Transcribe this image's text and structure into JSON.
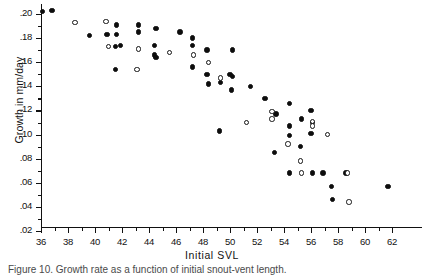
{
  "figure": {
    "caption": "Figure 10.  Growth rate as a function of initial snout-vent length."
  },
  "chart_data": {
    "type": "scatter",
    "title": "",
    "xlabel": "Initial SVL",
    "ylabel": "Growth in mm/day",
    "xlim": [
      35,
      63
    ],
    "ylim": [
      0.01,
      0.212
    ],
    "grid": false,
    "legend_position": "none",
    "x_ticks": [
      36,
      38,
      40,
      42,
      44,
      46,
      48,
      50,
      52,
      54,
      56,
      58,
      60,
      62
    ],
    "x_tick_labels": [
      "36",
      "38",
      "40",
      "42",
      "44",
      "46",
      "48",
      "50",
      "52",
      "54",
      "56",
      "58",
      "60",
      "62"
    ],
    "x_minor_ticks": [
      37,
      39,
      41,
      43,
      45,
      47,
      49,
      51,
      53,
      55,
      57,
      59,
      61
    ],
    "y_ticks": [
      0.02,
      0.04,
      0.06,
      0.08,
      0.1,
      0.12,
      0.14,
      0.16,
      0.18,
      0.2
    ],
    "y_tick_labels": [
      ".02",
      ".04",
      ".06",
      ".08",
      ".10",
      ".12",
      ".14",
      ".16",
      ".18",
      ".20"
    ],
    "y_minor_ticks": [
      0.03,
      0.05,
      0.07,
      0.09,
      0.11,
      0.13,
      0.15,
      0.17,
      0.19
    ],
    "series": [
      {
        "name": "filled",
        "marker": "filled-circle",
        "color": "#0d0d0d",
        "points": [
          [
            36.1,
            0.202
          ],
          [
            36.8,
            0.203
          ],
          [
            39.6,
            0.182
          ],
          [
            40.9,
            0.183
          ],
          [
            41.6,
            0.191
          ],
          [
            41.6,
            0.183
          ],
          [
            41.5,
            0.173
          ],
          [
            41.9,
            0.174
          ],
          [
            41.5,
            0.154
          ],
          [
            43.2,
            0.191
          ],
          [
            43.2,
            0.185
          ],
          [
            44.5,
            0.188
          ],
          [
            44.4,
            0.174
          ],
          [
            44.4,
            0.166
          ],
          [
            44.5,
            0.164
          ],
          [
            46.3,
            0.185
          ],
          [
            47.2,
            0.18
          ],
          [
            47.2,
            0.174
          ],
          [
            47.2,
            0.156
          ],
          [
            48.3,
            0.17
          ],
          [
            48.3,
            0.15
          ],
          [
            48.4,
            0.142
          ],
          [
            49.3,
            0.143
          ],
          [
            50.2,
            0.17
          ],
          [
            50.0,
            0.15
          ],
          [
            50.2,
            0.148
          ],
          [
            50.1,
            0.137
          ],
          [
            49.2,
            0.103
          ],
          [
            51.5,
            0.14
          ],
          [
            52.6,
            0.13
          ],
          [
            53.4,
            0.117
          ],
          [
            53.3,
            0.085
          ],
          [
            54.4,
            0.126
          ],
          [
            54.4,
            0.107
          ],
          [
            54.4,
            0.099
          ],
          [
            54.4,
            0.068
          ],
          [
            55.3,
            0.113
          ],
          [
            55.2,
            0.09
          ],
          [
            56.0,
            0.12
          ],
          [
            56.1,
            0.11
          ],
          [
            56.0,
            0.101
          ],
          [
            56.1,
            0.068
          ],
          [
            56.9,
            0.068
          ],
          [
            57.5,
            0.057
          ],
          [
            57.6,
            0.046
          ],
          [
            58.6,
            0.068
          ],
          [
            61.7,
            0.057
          ]
        ]
      },
      {
        "name": "open",
        "marker": "open-circle",
        "color": "#151515",
        "points": [
          [
            38.5,
            0.193
          ],
          [
            40.8,
            0.194
          ],
          [
            41.0,
            0.173
          ],
          [
            43.2,
            0.171
          ],
          [
            43.1,
            0.154
          ],
          [
            45.5,
            0.168
          ],
          [
            47.3,
            0.166
          ],
          [
            48.4,
            0.16
          ],
          [
            49.3,
            0.147
          ],
          [
            51.2,
            0.11
          ],
          [
            53.1,
            0.119
          ],
          [
            53.1,
            0.113
          ],
          [
            54.3,
            0.092
          ],
          [
            55.2,
            0.078
          ],
          [
            56.1,
            0.111
          ],
          [
            56.1,
            0.107
          ],
          [
            55.3,
            0.068
          ],
          [
            57.2,
            0.1
          ],
          [
            58.7,
            0.068
          ],
          [
            58.8,
            0.044
          ]
        ]
      }
    ]
  }
}
